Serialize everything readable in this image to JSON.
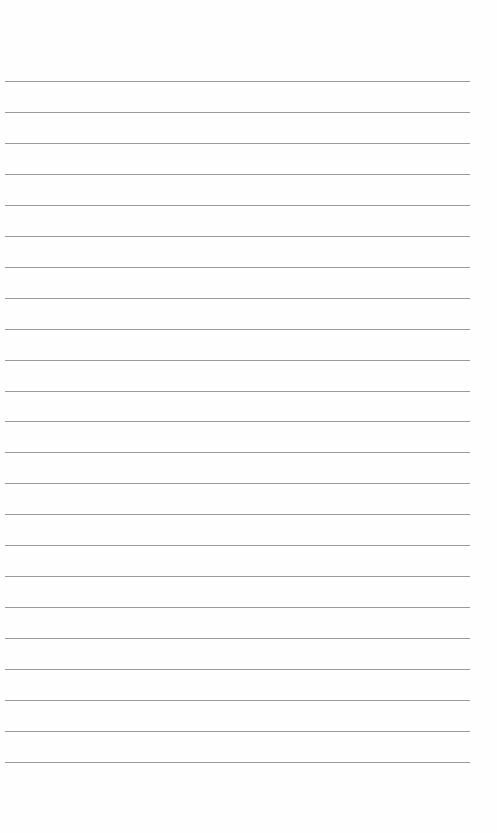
{
  "page": {
    "type": "lined-paper",
    "background_color": "#fefefe",
    "line_color": "#9a9a9a",
    "line_count": 23,
    "first_line_y": 81,
    "line_spacing": 30.95,
    "line_left": 5,
    "line_width": 465
  }
}
